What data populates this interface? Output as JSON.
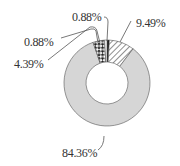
{
  "chart_data": {
    "type": "pie",
    "variant": "donut",
    "title": "",
    "slices": [
      {
        "label": "0.88%",
        "value": 0.88,
        "fill": "black"
      },
      {
        "label": "9.49%",
        "value": 9.49,
        "fill": "diagonal-hatch"
      },
      {
        "label": "84.36%",
        "value": 84.36,
        "fill": "light-gray"
      },
      {
        "label": "4.39%",
        "value": 4.39,
        "fill": "checkered"
      },
      {
        "label": "0.88%",
        "value": 0.88,
        "fill": "white"
      }
    ],
    "start_angle_deg": 0,
    "direction": "clockwise",
    "legend": "none",
    "colors": {
      "gray": "#d6d6d6",
      "black": "#111111",
      "outline": "#555555"
    }
  },
  "labels": {
    "top_small": "0.88%",
    "hatched": "9.49%",
    "left_small": "0.88%",
    "checkered": "4.39%",
    "gray": "84.36%"
  }
}
